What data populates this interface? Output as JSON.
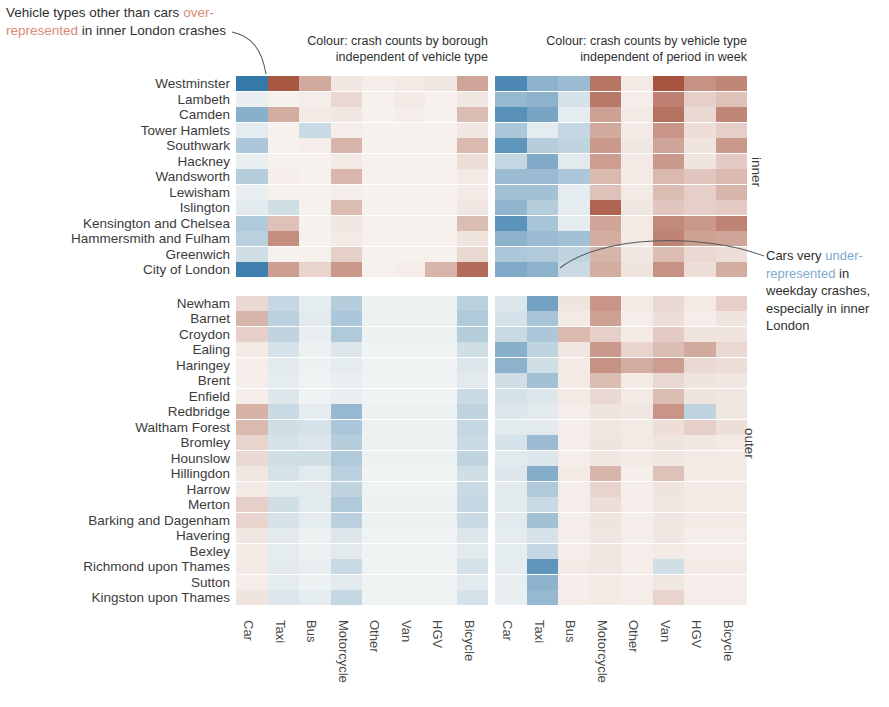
{
  "annotations": {
    "title_part1": "Vehicle types other than cars",
    "title_highlight": "over-represented",
    "title_part2": " in inner London crashes",
    "right_part1": "Cars very ",
    "right_highlight": "under-represented",
    "right_part2": " in weekday crashes, especially in inner London"
  },
  "panels": [
    {
      "id": "left",
      "caption_line1": "Colour: crash counts by borough",
      "caption_line2": "independent of vehicle type"
    },
    {
      "id": "right",
      "caption_line1": "Colour: crash counts by vehicle type",
      "caption_line2": "independent of period in week"
    }
  ],
  "group_labels": {
    "inner": "inner",
    "outer": "outer"
  },
  "colors": {
    "strong_blue": "#3a7fb5",
    "strong_red": "#b4432c",
    "mid_orange": "#d98a5e",
    "pale_blue": "#bfe0f0",
    "neutral": "#fbfaf7",
    "highlight_over": "#d98a72",
    "highlight_under": "#7fa9cf"
  },
  "chart_data": {
    "type": "heatmap",
    "title": "Vehicle types other than cars over-represented in inner London crashes",
    "xlabel": "",
    "ylabel": "",
    "grid": false,
    "legend": "none",
    "colormap": "RdBu reversed (blue = under-represented, red = over-represented)",
    "value_range": [
      -1,
      1
    ],
    "columns": [
      "Car",
      "Taxi",
      "Bus",
      "Motorcycle",
      "Other",
      "Van",
      "HGV",
      "Bicycle"
    ],
    "row_groups": [
      {
        "name": "inner",
        "rows": [
          "Westminster",
          "Lambeth",
          "Camden",
          "Tower Hamlets",
          "Southwark",
          "Hackney",
          "Wandsworth",
          "Lewisham",
          "Islington",
          "Kensington and Chelsea",
          "Hammersmith and Fulham",
          "Greenwich",
          "City of London"
        ]
      },
      {
        "name": "outer",
        "rows": [
          "Newham",
          "Barnet",
          "Croydon",
          "Ealing",
          "Haringey",
          "Brent",
          "Enfield",
          "Redbridge",
          "Waltham Forest",
          "Bromley",
          "Hounslow",
          "Hillingdon",
          "Harrow",
          "Merton",
          "Barking and Dagenham",
          "Havering",
          "Bexley",
          "Richmond upon Thames",
          "Sutton",
          "Kingston upon Thames"
        ]
      }
    ],
    "panels": [
      {
        "name": "crash counts by borough independent of vehicle type",
        "values": [
          [
            -0.85,
            0.78,
            0.32,
            0.05,
            0.03,
            0.04,
            0.05,
            0.34
          ],
          [
            -0.04,
            0.02,
            0.03,
            0.1,
            0.02,
            0.04,
            0.02,
            0.05
          ],
          [
            -0.42,
            0.3,
            0.04,
            0.05,
            0.02,
            0.03,
            0.02,
            0.22
          ],
          [
            -0.05,
            0.02,
            -0.14,
            0.03,
            0.02,
            0.02,
            0.02,
            0.05
          ],
          [
            -0.26,
            0.02,
            0.03,
            0.26,
            0.02,
            0.02,
            0.02,
            0.24
          ],
          [
            -0.04,
            0.02,
            0.02,
            0.04,
            0.02,
            0.02,
            0.02,
            0.08
          ],
          [
            -0.22,
            0.03,
            0.02,
            0.25,
            0.02,
            0.02,
            0.02,
            0.04
          ],
          [
            -0.04,
            0.02,
            0.02,
            0.03,
            0.02,
            0.02,
            0.02,
            0.04
          ],
          [
            -0.06,
            -0.12,
            0.02,
            0.22,
            0.02,
            0.02,
            0.02,
            0.05
          ],
          [
            -0.24,
            0.2,
            0.02,
            0.05,
            0.02,
            0.02,
            0.02,
            0.22
          ],
          [
            -0.2,
            0.46,
            0.02,
            0.04,
            0.02,
            0.02,
            0.02,
            0.06
          ],
          [
            -0.12,
            0.02,
            0.02,
            0.14,
            0.02,
            0.02,
            0.02,
            0.1
          ],
          [
            -0.8,
            0.38,
            0.12,
            0.4,
            0.02,
            0.03,
            0.26,
            0.66
          ],
          [
            0.1,
            -0.16,
            -0.05,
            -0.22,
            -0.03,
            -0.03,
            -0.03,
            -0.2
          ],
          [
            0.26,
            -0.2,
            -0.06,
            -0.26,
            -0.03,
            -0.03,
            -0.03,
            -0.24
          ],
          [
            0.14,
            -0.18,
            -0.04,
            -0.24,
            -0.03,
            -0.03,
            -0.03,
            -0.22
          ],
          [
            0.04,
            -0.1,
            -0.03,
            -0.08,
            -0.02,
            -0.02,
            -0.02,
            -0.12
          ],
          [
            0.03,
            -0.06,
            -0.03,
            -0.05,
            -0.02,
            -0.02,
            -0.02,
            -0.08
          ],
          [
            0.03,
            -0.05,
            -0.02,
            -0.04,
            -0.02,
            -0.02,
            -0.02,
            -0.06
          ],
          [
            0.03,
            -0.08,
            -0.02,
            -0.04,
            -0.02,
            -0.02,
            -0.02,
            -0.14
          ],
          [
            0.28,
            -0.14,
            -0.05,
            -0.36,
            -0.03,
            -0.03,
            -0.03,
            -0.18
          ],
          [
            0.24,
            -0.12,
            -0.1,
            -0.26,
            -0.03,
            -0.03,
            -0.03,
            -0.16
          ],
          [
            0.12,
            -0.1,
            -0.08,
            -0.22,
            -0.03,
            -0.03,
            -0.03,
            -0.14
          ],
          [
            0.1,
            -0.12,
            -0.12,
            -0.24,
            -0.03,
            -0.03,
            -0.03,
            -0.18
          ],
          [
            0.05,
            -0.1,
            -0.06,
            -0.2,
            -0.02,
            -0.02,
            -0.02,
            -0.12
          ],
          [
            0.04,
            -0.06,
            -0.06,
            -0.18,
            -0.02,
            -0.02,
            -0.02,
            -0.14
          ],
          [
            0.14,
            -0.12,
            -0.06,
            -0.24,
            -0.03,
            -0.03,
            -0.03,
            -0.16
          ],
          [
            0.12,
            -0.1,
            -0.05,
            -0.2,
            -0.03,
            -0.03,
            -0.03,
            -0.14
          ],
          [
            0.05,
            -0.06,
            -0.03,
            -0.08,
            -0.02,
            -0.02,
            -0.02,
            -0.08
          ],
          [
            0.04,
            -0.05,
            -0.03,
            -0.06,
            -0.02,
            -0.02,
            -0.02,
            -0.06
          ],
          [
            0.04,
            -0.06,
            -0.04,
            -0.14,
            -0.02,
            -0.02,
            -0.02,
            -0.1
          ],
          [
            0.03,
            -0.05,
            -0.03,
            -0.06,
            -0.02,
            -0.02,
            -0.02,
            -0.06
          ],
          [
            0.06,
            -0.08,
            -0.05,
            -0.16,
            -0.02,
            -0.02,
            -0.02,
            -0.1
          ],
          [
            0.03,
            -0.04,
            -0.03,
            -0.05,
            -0.02,
            -0.02,
            -0.02,
            -0.05
          ],
          [
            0.02,
            -0.03,
            -0.02,
            -0.04,
            -0.02,
            -0.02,
            -0.02,
            -0.04
          ],
          [
            0.02,
            -0.03,
            -0.02,
            -0.03,
            -0.02,
            -0.02,
            -0.02,
            -0.03
          ],
          [
            0.02,
            -0.03,
            -0.02,
            -0.03,
            -0.01,
            -0.01,
            -0.01,
            -0.03
          ]
        ]
      },
      {
        "name": "crash counts by vehicle type independent of period in week",
        "values": [
          [
            -0.72,
            -0.4,
            -0.34,
            0.6,
            0.04,
            0.8,
            0.44,
            0.5
          ],
          [
            -0.36,
            -0.4,
            -0.1,
            0.58,
            0.03,
            0.54,
            0.14,
            0.2
          ],
          [
            -0.66,
            -0.5,
            -0.05,
            0.36,
            0.04,
            0.62,
            0.1,
            0.5
          ],
          [
            -0.26,
            -0.05,
            -0.16,
            0.32,
            0.04,
            0.42,
            0.08,
            0.14
          ],
          [
            -0.62,
            -0.22,
            -0.18,
            0.4,
            0.05,
            0.34,
            0.06,
            0.4
          ],
          [
            -0.16,
            -0.46,
            -0.06,
            0.38,
            0.04,
            0.4,
            0.06,
            0.16
          ],
          [
            -0.34,
            -0.34,
            -0.26,
            0.24,
            0.04,
            0.24,
            0.18,
            0.24
          ],
          [
            -0.3,
            -0.3,
            -0.05,
            0.2,
            0.04,
            0.22,
            0.14,
            0.26
          ],
          [
            -0.38,
            -0.22,
            -0.05,
            0.7,
            0.05,
            0.18,
            0.14,
            0.16
          ],
          [
            -0.64,
            -0.28,
            -0.05,
            0.34,
            0.04,
            0.48,
            0.4,
            0.52
          ],
          [
            -0.4,
            -0.34,
            -0.3,
            0.3,
            0.04,
            0.52,
            0.36,
            0.34
          ],
          [
            -0.26,
            -0.24,
            -0.18,
            0.26,
            0.05,
            0.22,
            0.1,
            0.08
          ],
          [
            -0.46,
            -0.4,
            -0.14,
            0.3,
            0.06,
            0.44,
            0.08,
            0.3
          ],
          [
            -0.08,
            -0.52,
            0.06,
            0.42,
            0.04,
            0.1,
            0.04,
            0.14
          ],
          [
            -0.1,
            -0.28,
            0.04,
            0.36,
            0.03,
            0.08,
            0.03,
            0.06
          ],
          [
            -0.14,
            -0.26,
            0.24,
            0.14,
            0.04,
            0.16,
            0.06,
            0.06
          ],
          [
            -0.42,
            -0.18,
            0.05,
            0.4,
            0.12,
            0.22,
            0.32,
            0.1
          ],
          [
            -0.4,
            -0.12,
            0.04,
            0.44,
            0.3,
            0.38,
            0.1,
            0.08
          ],
          [
            -0.12,
            -0.3,
            0.04,
            0.22,
            0.04,
            0.1,
            0.06,
            0.05
          ],
          [
            -0.1,
            -0.08,
            0.04,
            0.1,
            0.04,
            0.22,
            0.06,
            0.05
          ],
          [
            -0.08,
            -0.06,
            0.03,
            0.06,
            0.05,
            0.42,
            -0.18,
            0.05
          ],
          [
            -0.06,
            -0.06,
            0.03,
            0.05,
            0.04,
            0.08,
            0.14,
            0.08
          ],
          [
            -0.1,
            -0.34,
            0.03,
            0.06,
            0.04,
            0.06,
            0.05,
            0.04
          ],
          [
            -0.06,
            -0.08,
            0.03,
            0.05,
            0.04,
            0.05,
            0.04,
            0.04
          ],
          [
            -0.08,
            -0.44,
            0.04,
            0.26,
            0.03,
            0.2,
            0.04,
            0.04
          ],
          [
            -0.06,
            -0.24,
            0.03,
            0.12,
            0.03,
            0.06,
            0.04,
            0.04
          ],
          [
            -0.06,
            -0.14,
            0.03,
            0.08,
            0.03,
            0.05,
            0.04,
            0.04
          ],
          [
            -0.06,
            -0.3,
            0.03,
            0.06,
            0.03,
            0.05,
            0.04,
            0.04
          ],
          [
            -0.05,
            -0.1,
            0.03,
            0.05,
            0.03,
            0.05,
            0.03,
            0.03
          ],
          [
            -0.05,
            -0.16,
            0.03,
            0.05,
            0.03,
            0.04,
            0.03,
            0.03
          ],
          [
            -0.05,
            -0.62,
            0.04,
            0.05,
            0.03,
            -0.12,
            0.04,
            0.04
          ],
          [
            -0.04,
            -0.4,
            0.03,
            0.04,
            0.03,
            0.05,
            0.03,
            0.03
          ],
          [
            -0.04,
            -0.36,
            0.03,
            0.04,
            0.03,
            0.12,
            0.03,
            0.03
          ],
          [
            -0.04,
            -0.28,
            0.03,
            0.04,
            0.03,
            0.04,
            0.03,
            0.03
          ],
          [
            -0.03,
            -0.22,
            0.02,
            0.03,
            0.02,
            0.04,
            0.02,
            0.02
          ],
          [
            -0.03,
            -0.12,
            0.02,
            0.03,
            0.02,
            0.03,
            0.02,
            0.02
          ],
          [
            -0.03,
            -0.08,
            0.02,
            0.03,
            0.02,
            0.03,
            0.02,
            0.02
          ]
        ]
      }
    ]
  }
}
